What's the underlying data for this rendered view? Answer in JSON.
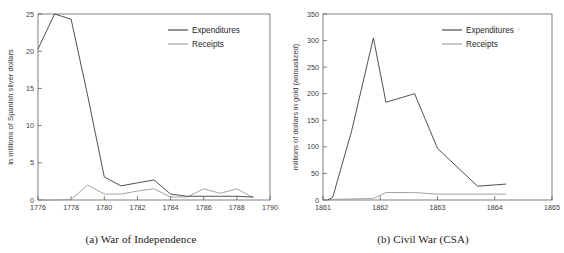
{
  "figure": {
    "panels": [
      {
        "id": "panel-a",
        "caption": "(a) War of Independence",
        "legend": {
          "expenditures": "Expenditures",
          "receipts": "Receipts"
        },
        "colors": {
          "expenditures": "#3d3d3d",
          "receipts": "#9a9a9a",
          "axis": "#4a4a4a"
        },
        "chart_data": {
          "type": "line",
          "title": "",
          "xlabel": "",
          "ylabel": "in millions of Spanish silver dollars",
          "xlim": [
            1776,
            1790
          ],
          "ylim": [
            0,
            25
          ],
          "xticks": [
            1776,
            1778,
            1780,
            1782,
            1784,
            1786,
            1788,
            1790
          ],
          "yticks": [
            0,
            5,
            10,
            15,
            20,
            25
          ],
          "grid": false,
          "legend_position": "upper right",
          "x": [
            1776,
            1777,
            1778,
            1779,
            1780,
            1781,
            1782,
            1783,
            1784,
            1785,
            1786,
            1787,
            1788,
            1789
          ],
          "series": [
            {
              "name": "Expenditures",
              "values": [
                20.3,
                25.0,
                24.3,
                14.0,
                3.1,
                1.9,
                2.3,
                2.7,
                0.8,
                0.5,
                0.5,
                0.5,
                0.5,
                0.4
              ]
            },
            {
              "name": "Receipts",
              "values": [
                0.0,
                0.0,
                0.1,
                2.0,
                0.8,
                0.8,
                1.2,
                1.5,
                0.4,
                0.4,
                1.5,
                0.9,
                1.5,
                0.3
              ]
            }
          ]
        }
      },
      {
        "id": "panel-b",
        "caption": "(b) Civil War (CSA)",
        "legend": {
          "expenditures": "Expenditures",
          "receipts": "Receipts"
        },
        "colors": {
          "expenditures": "#3d3d3d",
          "receipts": "#9a9a9a",
          "axis": "#4a4a4a"
        },
        "chart_data": {
          "type": "line",
          "title": "",
          "xlabel": "",
          "ylabel": "millions of dollars in gold (annualized)",
          "xlim": [
            1861,
            1865
          ],
          "ylim": [
            0,
            350
          ],
          "xticks": [
            1861,
            1862,
            1863,
            1864,
            1865
          ],
          "yticks": [
            0,
            50,
            100,
            150,
            200,
            250,
            300,
            350
          ],
          "grid": false,
          "legend_position": "upper right",
          "x": [
            1861.08,
            1861.17,
            1861.5,
            1861.88,
            1862.1,
            1862.6,
            1863.0,
            1863.7,
            1864.2
          ],
          "series": [
            {
              "name": "Expenditures",
              "values": [
                0.0,
                5.0,
                130.0,
                305.0,
                184.0,
                200.0,
                97.0,
                26.0,
                30.0
              ]
            },
            {
              "name": "Receipts",
              "values": [
                0.0,
                1.0,
                2.0,
                3.0,
                14.0,
                14.0,
                11.0,
                11.0,
                11.0
              ]
            }
          ]
        }
      }
    ]
  }
}
